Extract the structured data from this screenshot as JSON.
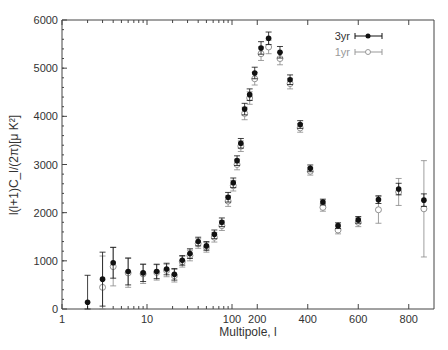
{
  "chart_data": {
    "type": "scatter",
    "title": "",
    "xlabel": "Multipole, l",
    "ylabel": "l(l+1)C_l/(2π)[μ K²]",
    "x_scale": "log below 100, linear above",
    "xlim": [
      1,
      900
    ],
    "ylim": [
      0,
      6000
    ],
    "x_ticks": [
      "1",
      "10",
      "100",
      "200",
      "400",
      "600",
      "800"
    ],
    "y_ticks": [
      "0",
      "1000",
      "2000",
      "3000",
      "4000",
      "5000",
      "6000"
    ],
    "legend": {
      "position": "upper right",
      "entries": [
        "3yr",
        "1yr"
      ]
    },
    "grid": false,
    "series": [
      {
        "name": "3yr",
        "marker": "filled-circle",
        "color": "#111111",
        "x": [
          2,
          3,
          4,
          6,
          9,
          13,
          17,
          21,
          26,
          32,
          40,
          50,
          62,
          76,
          90,
          105,
          120,
          135,
          150,
          170,
          190,
          215,
          245,
          290,
          330,
          370,
          410,
          460,
          520,
          600,
          680,
          760,
          860
        ],
        "y": [
          140,
          620,
          960,
          780,
          750,
          780,
          830,
          720,
          1010,
          1150,
          1400,
          1310,
          1550,
          1800,
          2320,
          2620,
          3080,
          3440,
          4150,
          4450,
          4900,
          5420,
          5620,
          5330,
          4760,
          3830,
          2920,
          2220,
          1730,
          1850,
          2270,
          2490,
          2260
        ],
        "err": [
          560,
          560,
          320,
          280,
          180,
          150,
          120,
          120,
          100,
          100,
          90,
          90,
          90,
          90,
          100,
          100,
          100,
          100,
          120,
          120,
          120,
          130,
          130,
          120,
          100,
          80,
          70,
          60,
          60,
          70,
          80,
          120,
          130
        ]
      },
      {
        "name": "1yr",
        "marker": "open-circle",
        "color": "#888888",
        "x": [
          3,
          4,
          6,
          9,
          13,
          17,
          21,
          26,
          32,
          40,
          50,
          62,
          76,
          90,
          105,
          120,
          135,
          150,
          170,
          190,
          215,
          245,
          290,
          330,
          370,
          410,
          460,
          520,
          600,
          680,
          760,
          860
        ],
        "y": [
          450,
          880,
          750,
          730,
          760,
          800,
          690,
          980,
          1110,
          1360,
          1280,
          1490,
          1730,
          2240,
          2560,
          3000,
          3380,
          4060,
          4380,
          4780,
          5300,
          5440,
          5200,
          4680,
          3760,
          2860,
          2110,
          1640,
          1800,
          2060,
          2430,
          2080
        ],
        "err": [
          650,
          400,
          300,
          200,
          160,
          130,
          130,
          110,
          110,
          100,
          100,
          100,
          100,
          110,
          110,
          110,
          110,
          130,
          130,
          130,
          140,
          140,
          130,
          110,
          90,
          80,
          80,
          80,
          90,
          280,
          280,
          1000
        ]
      }
    ]
  },
  "legend": {
    "label_3yr": "3yr",
    "label_1yr": "1yr"
  },
  "axes": {
    "xlabel": "Multipole, l",
    "ylabel": "l(l+1)C_l/(2π)[μ K²]"
  }
}
